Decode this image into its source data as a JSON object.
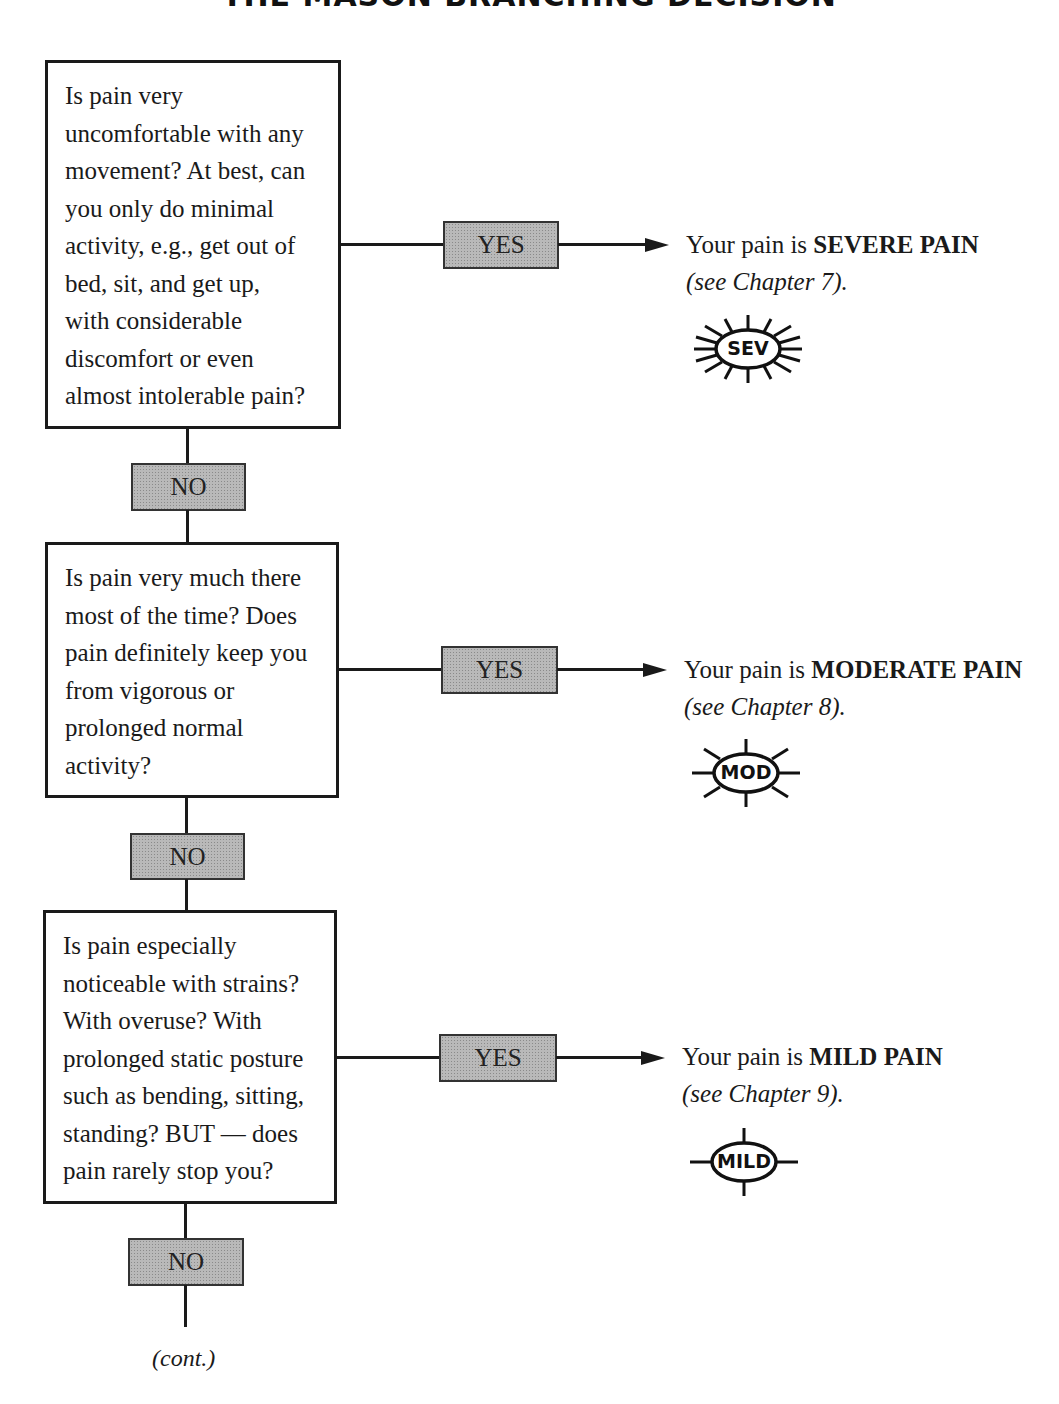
{
  "title": "THE MASON BRANCHING DECISION",
  "steps": [
    {
      "question": "Is pain very\nuncomfortable with any\nmovement? At best, can\nyou only do minimal\nactivity, e.g., get out of\nbed, sit, and get up,\nwith considerable\ndiscomfort or even\nalmost intolerable pain?",
      "yes_label": "YES",
      "no_label": "NO",
      "result_prefix": "Your pain is ",
      "result_level": "SEVERE PAIN",
      "result_ref": "(see Chapter 7).",
      "badge_text": "SEV",
      "badge_icon": "sunburst-many-rays-icon"
    },
    {
      "question": "Is pain very much there\nmost of the time? Does\npain definitely keep you\nfrom vigorous or\nprolonged normal\nactivity?",
      "yes_label": "YES",
      "no_label": "NO",
      "result_prefix": "Your pain is ",
      "result_level": "MODERATE PAIN",
      "result_ref": "(see Chapter 8).",
      "badge_text": "MOD",
      "badge_icon": "sunburst-eight-rays-icon"
    },
    {
      "question": "Is pain especially\nnoticeable with strains?\nWith overuse? With\nprolonged static posture\nsuch as bending, sitting,\nstanding? BUT — does\npain rarely stop you?",
      "yes_label": "YES",
      "no_label": "NO",
      "result_prefix": "Your pain is ",
      "result_level": "MILD PAIN",
      "result_ref": "(see Chapter 9).",
      "badge_text": "MILD",
      "badge_icon": "crosshair-four-rays-icon"
    }
  ],
  "continuation": "(cont.)"
}
